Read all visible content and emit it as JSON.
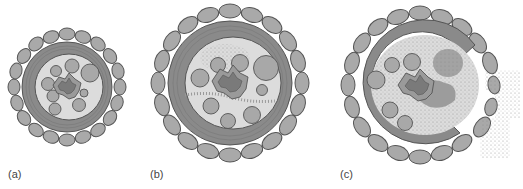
{
  "figure": {
    "panels": [
      {
        "id": "a",
        "label": "(a)",
        "description": "Healthy stem cross-section: cell ring, vascular ring, intact pith with bundles"
      },
      {
        "id": "b",
        "label": "(b)",
        "description": "Early infection: stippled pathogen spread in pith and along vascular strands"
      },
      {
        "id": "c",
        "label": "(c)",
        "description": "Advanced infection: pith invaded, epidermis ruptured, spores released outward"
      }
    ]
  },
  "colors": {
    "cell_fill": "#a9a9a9",
    "cell_stroke": "#555555",
    "ring_dark": "#8a8a8a",
    "pith_fill": "#dcdcdc",
    "bundle_fill": "#a8a8a8",
    "core_outer": "#9a9a9a",
    "core_inner": "#7a7a7a",
    "stipple": "#888888",
    "infection_blot": "#9c9c9c",
    "label_text": "#444444"
  }
}
